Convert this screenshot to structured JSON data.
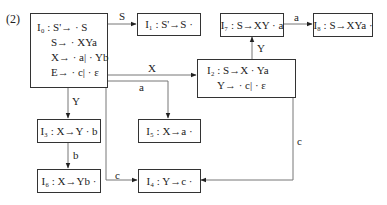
{
  "figure_number": "(2)",
  "states": {
    "I0": {
      "lines": [
        "I₀ : S'→ · S",
        "S→ · XYa",
        "X→ · a| · Yb",
        "E→ · c| · ε"
      ]
    },
    "I1": {
      "text": "I₁ : S'→S ·"
    },
    "I2": {
      "lines": [
        "I₂ : S→X · Ya",
        "Y→ · c| · ε"
      ]
    },
    "I3": {
      "text": "I₃ : X→Y · b"
    },
    "I4": {
      "text": "I₄ : Y→c ·"
    },
    "I5": {
      "text": "I₅ : X→a ·"
    },
    "I6": {
      "text": "I₆ : X→Yb ·"
    },
    "I7": {
      "text": "I₇ : S→XY · a"
    },
    "I8": {
      "text": "I₈ : S→XYa ·"
    }
  },
  "edges": [
    {
      "from": "I0",
      "to": "I1",
      "label": "S"
    },
    {
      "from": "I0",
      "to": "I2",
      "label": "X"
    },
    {
      "from": "I0",
      "to": "I5",
      "label": "a"
    },
    {
      "from": "I0",
      "to": "I3",
      "label": "Y"
    },
    {
      "from": "I0",
      "to": "I4",
      "label": "c"
    },
    {
      "from": "I3",
      "to": "I6",
      "label": "b"
    },
    {
      "from": "I2",
      "to": "I7",
      "label": "Y"
    },
    {
      "from": "I7",
      "to": "I8",
      "label": "a"
    },
    {
      "from": "I2",
      "to": "I4",
      "label": "c"
    }
  ]
}
